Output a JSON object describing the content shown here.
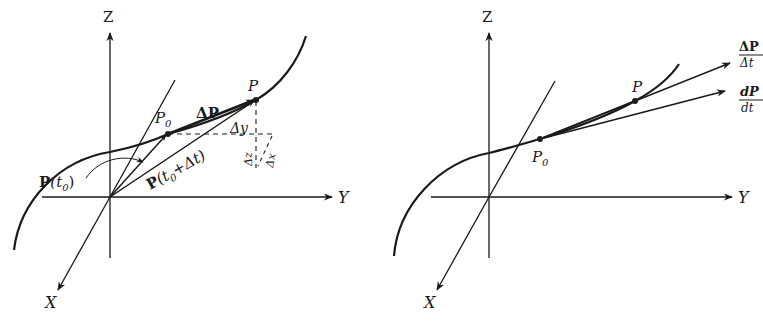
{
  "figures": [
    {
      "id": "left",
      "description": "Secant vector between P0 and P on a space curve",
      "axes": {
        "x_label": "X",
        "y_label": "Y",
        "z_label": "Z"
      },
      "points": {
        "p0_label": "P",
        "p0_sub": "0",
        "p_label": "P"
      },
      "vectors": {
        "delta_p": "ΔP",
        "p_t0_main": "P",
        "p_t0_args": "(t",
        "p_t0_sub": "0",
        "p_t0_close": ")",
        "p_t0dt_main": "P",
        "p_t0dt_args": "(t",
        "p_t0dt_sub": "0",
        "p_t0dt_rest": "+Δt)"
      },
      "increments": {
        "dy": "Δy",
        "dz": "Δz",
        "dx": "Δx"
      }
    },
    {
      "id": "right",
      "description": "Secant direction ΔP/Δt approaching tangent dP/dt",
      "axes": {
        "x_label": "X",
        "y_label": "Y",
        "z_label": "Z"
      },
      "points": {
        "p0_label": "P",
        "p0_sub": "0",
        "p_label": "P"
      },
      "ratios": {
        "secant_num": "ΔP",
        "secant_den": "Δt",
        "tangent_num": "dP",
        "tangent_den": "dt"
      }
    }
  ],
  "colors": {
    "ink": "#1a1a1a",
    "background": "#ffffff"
  }
}
